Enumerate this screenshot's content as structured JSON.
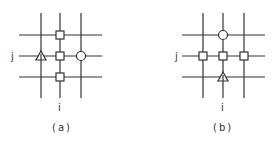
{
  "diagrams": [
    {
      "caption": "(a)",
      "row_label": "j",
      "col_label": "i",
      "grid": {
        "cols_x": [
          41,
          60,
          81
        ],
        "rows_y": [
          35,
          56,
          77
        ],
        "x_span": [
          19,
          102
        ],
        "y_span": [
          13,
          98
        ]
      },
      "nodes": [
        {
          "shape": "square",
          "col": 1,
          "row": 0
        },
        {
          "shape": "square",
          "col": 1,
          "row": 1
        },
        {
          "shape": "square",
          "col": 1,
          "row": 2
        },
        {
          "shape": "triangle",
          "col": 0,
          "row": 1
        },
        {
          "shape": "circle",
          "col": 2,
          "row": 1
        }
      ]
    },
    {
      "caption": "(b)",
      "row_label": "j",
      "col_label": "i",
      "grid": {
        "cols_x": [
          203,
          223,
          244
        ],
        "rows_y": [
          35,
          56,
          77
        ],
        "x_span": [
          182,
          265
        ],
        "y_span": [
          13,
          98
        ]
      },
      "nodes": [
        {
          "shape": "square",
          "col": 0,
          "row": 1
        },
        {
          "shape": "square",
          "col": 1,
          "row": 1
        },
        {
          "shape": "square",
          "col": 2,
          "row": 1
        },
        {
          "shape": "circle",
          "col": 1,
          "row": 0
        },
        {
          "shape": "triangle",
          "col": 1,
          "row": 2
        }
      ]
    }
  ],
  "colors": {
    "line": "#333333",
    "background": "#ffffff"
  }
}
